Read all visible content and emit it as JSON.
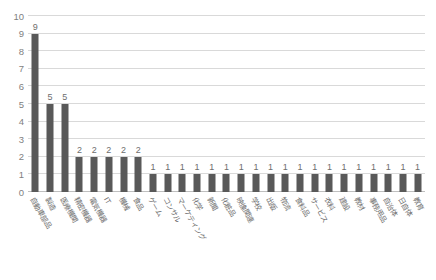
{
  "chart_data": {
    "type": "bar",
    "title": "",
    "xlabel": "",
    "ylabel": "",
    "ylim": [
      0,
      10
    ],
    "ytick_step": 1,
    "grid": true,
    "legend": false,
    "orientation": "vertical",
    "bar_color": "#595959",
    "gridline_color": "#d9d9d9",
    "label_color": "#6e6e6e",
    "yticks": [
      "0",
      "1",
      "2",
      "3",
      "4",
      "5",
      "6",
      "7",
      "8",
      "9",
      "10"
    ],
    "categories": [
      "自動車部品",
      "製造",
      "医療機関",
      "精密機器",
      "電気機器",
      "IT",
      "機械",
      "食品",
      "ゲーム",
      "コンサル",
      "マーケティング",
      "化学",
      "新聞",
      "化粧品",
      "映像関連",
      "学校",
      "出版",
      "物流",
      "食料品",
      "サービス",
      "衣料",
      "建設",
      "教材",
      "事務用品",
      "自治体",
      "日自体",
      "教育"
    ],
    "values": [
      9,
      5,
      5,
      2,
      2,
      2,
      2,
      2,
      1,
      1,
      1,
      1,
      1,
      1,
      1,
      1,
      1,
      1,
      1,
      1,
      1,
      1,
      1,
      1,
      1,
      1,
      1
    ],
    "data_labels": [
      "9",
      "5",
      "5",
      "2",
      "2",
      "2",
      "2",
      "2",
      "1",
      "1",
      "1",
      "1",
      "1",
      "1",
      "1",
      "1",
      "1",
      "1",
      "1",
      "1",
      "1",
      "1",
      "1",
      "1",
      "1",
      "1",
      "1"
    ]
  },
  "footer": {
    "note": ""
  }
}
